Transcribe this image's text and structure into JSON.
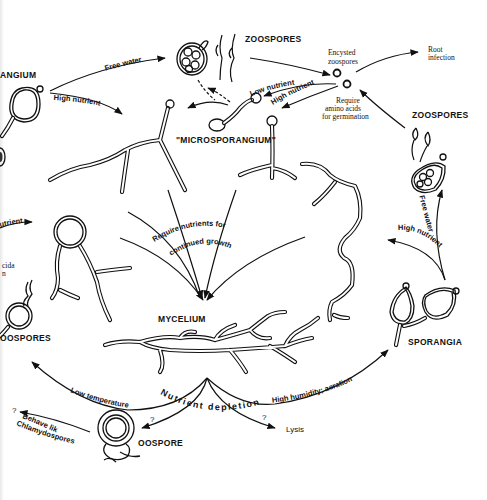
{
  "figure": {
    "type": "life-cycle diagram"
  },
  "stages": {
    "zoospores_top": "ZOOSPORES",
    "zoospores_right": "ZOOSPORES",
    "sporangium_left": "ANGIUM",
    "microsporangium": "\"MICROSPORANGIUM\"",
    "encysted": "Encysted",
    "encysted2": "zoospores",
    "root_infection_1": "Root",
    "root_infection_2": "infection",
    "require_1": "Require",
    "require_2": "amino acids",
    "require_3": "for germination",
    "mycelium": "MYCELIUM",
    "sporangia": "SPORANGIA",
    "oospore": "OOSPORE",
    "oospores_left": "OOSPORES",
    "lysis": "Lysis",
    "left_cut_1": "cida",
    "left_cut_2": "n"
  },
  "conditions": {
    "free_water_top": "Free water",
    "high_nutrient_top": "High nutrient",
    "low_nutrient": "Low nutrient",
    "high_nutrient_mid": "High nutrient",
    "free_water_right": "Free water",
    "high_nutrient_right": "High nutrient",
    "nutrient_left_cut": "utrient",
    "require_nutrients_1": "Require nutrients for",
    "require_nutrients_2": "continued growth",
    "low_temperature": "Low temperature",
    "nutrient_depletion": "Nutrient depletion",
    "high_humidity": "High humidity; aeration",
    "behave_1": "Behave like",
    "behave_2": "Chlamydospores?",
    "question_1": "?",
    "question_2": "?",
    "question_3": "?"
  }
}
